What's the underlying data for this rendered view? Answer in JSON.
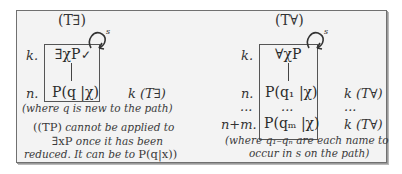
{
  "left_rule": {
    "title": "(T∃)",
    "line_k_label": "k.",
    "line_k_formula": "∃χP",
    "check_mark": "✓",
    "loop_label": "s",
    "line_n_label": "n.",
    "line_n_formula": "P(q |χ)",
    "line_n_justification": "k (T∃)",
    "note_1": "(where q is new to the path)",
    "note_2_a": "((TP)",
    "note_2_b": "cannot be applied to",
    "note_3_a": "∃xP",
    "note_3_b": "once it has been",
    "note_4_a": "reduced. It can be to",
    "note_4_b": "P(q|x))"
  },
  "right_rule": {
    "title": "(T∀)",
    "line_k_label": "k.",
    "line_k_formula": "∀χP",
    "loop_label": "s",
    "line_n_label": "n.",
    "line_n_formula": "P(q₁ |χ)",
    "line_n_justification": "k (T∀)",
    "ellipsis_label": "...",
    "ellipsis_formula": "...",
    "ellipsis_justification": "...",
    "line_nm_label": "n+m.",
    "line_nm_formula": "P(qₘ |χ)",
    "line_nm_justification": "k (T∀)",
    "note_1": "(where q₁–qₙ are each name to",
    "note_2": "occur in s on the path)"
  }
}
